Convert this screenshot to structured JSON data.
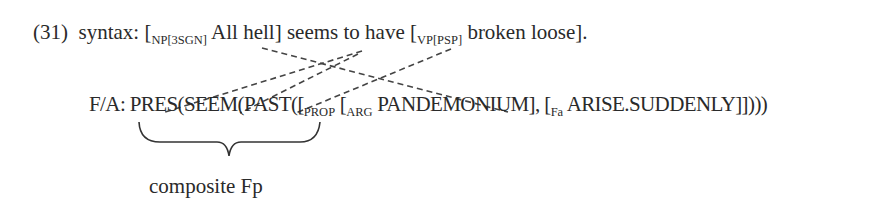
{
  "example": {
    "number": "(31)",
    "syntax": {
      "label": "syntax:",
      "np_open": "[",
      "np_sub": "NP[3SGN]",
      "np_text": "All hell]",
      "middle": "seems to have",
      "vp_open": "[",
      "vp_sub": "VP[PSP]",
      "vp_text": "broken loose]."
    },
    "fa": {
      "label": "F/A:",
      "pres": "PRES(",
      "seem": "SEEM(",
      "past": "PAST(",
      "open1": "([",
      "prop_sub": "PROP",
      "open2": "[",
      "arg_sub": "ARG",
      "arg_text": "PANDEMONIUM],",
      "open3": "[",
      "fa_sub": "Fa",
      "fa_text": "ARISE.SUDDENLY]])))"
    },
    "brace_label": "composite Fp"
  },
  "links": [
    {
      "from": "All hell",
      "to": "PANDEMONIUM"
    },
    {
      "from": "seems",
      "to": "PRES"
    },
    {
      "from": "seems",
      "to": "SEEM"
    },
    {
      "from": "have",
      "to": "PAST"
    }
  ]
}
